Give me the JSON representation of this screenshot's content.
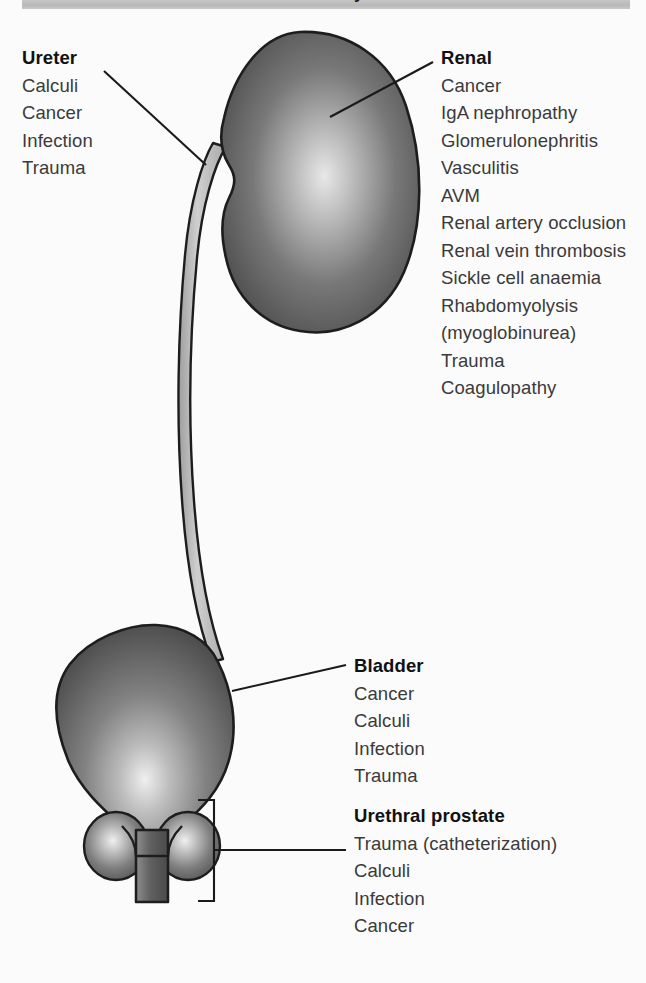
{
  "header": {
    "title": "Causes of haematuria by anatomical site",
    "bar_color": "#bfbfbf"
  },
  "colors": {
    "page_background": "#fbfbfb",
    "organ_dark": "#4d4d4d",
    "organ_light": "#e9e9e9",
    "ureter_fill": "#c4c4c4",
    "outline": "#1a1a1a",
    "leader_line": "#1a1a1a",
    "text": "#3a3a3a",
    "heading": "#111111"
  },
  "labels": {
    "ureter": {
      "heading": "Ureter",
      "items": [
        "Calculi",
        "Cancer",
        "Infection",
        "Trauma"
      ]
    },
    "renal": {
      "heading": "Renal",
      "items": [
        "Cancer",
        "IgA nephropathy",
        "Glomerulonephritis",
        "Vasculitis",
        "AVM",
        "Renal artery occlusion",
        "Renal vein thrombosis",
        "Sickle cell anaemia",
        "Rhabdomyolysis",
        "(myoglobinurea)",
        "Trauma",
        "Coagulopathy"
      ]
    },
    "bladder": {
      "heading": "Bladder",
      "items": [
        "Cancer",
        "Calculi",
        "Infection",
        "Trauma"
      ]
    },
    "urethral_prostate": {
      "heading": "Urethral prostate",
      "items": [
        "Trauma (catheterization)",
        "Calculi",
        "Infection",
        "Cancer"
      ]
    }
  },
  "anatomy": {
    "kidney": "kidney-organ",
    "ureter": "ureter-tube",
    "bladder": "bladder-organ",
    "prostate_left": "prostate-lobe-left",
    "prostate_right": "prostate-lobe-right",
    "urethra": "urethra-stem"
  }
}
